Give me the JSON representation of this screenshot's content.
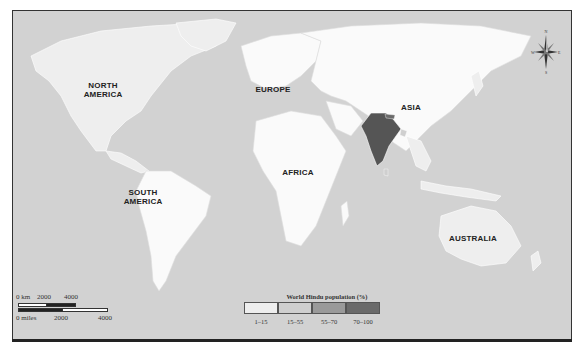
{
  "map": {
    "title": "World Hindu population (%)",
    "continent_labels": [
      {
        "name": "NORTH AMERICA",
        "line1": "NORTH",
        "line2": "AMERICA"
      },
      {
        "name": "SOUTH AMERICA",
        "line1": "SOUTH",
        "line2": "AMERICA"
      },
      {
        "name": "EUROPE",
        "line1": "EUROPE",
        "line2": ""
      },
      {
        "name": "AFRICA",
        "line1": "AFRICA",
        "line2": ""
      },
      {
        "name": "ASIA",
        "line1": "ASIA",
        "line2": ""
      },
      {
        "name": "AUSTRALIA",
        "line1": "AUSTRALIA",
        "line2": ""
      }
    ],
    "legend": {
      "title": "World Hindu population (%)",
      "items": [
        {
          "label": "1–15",
          "color": "#eeeeee"
        },
        {
          "label": "15–55",
          "color": "#cfcfcf"
        },
        {
          "label": "55–70",
          "color": "#9a9a9a"
        },
        {
          "label": "70–100",
          "color": "#6a6a6a"
        }
      ]
    },
    "scale_bar": {
      "km_label": "0 km",
      "km_ticks": [
        "2000",
        "4000"
      ],
      "miles_label": "0 miles",
      "miles_ticks": [
        "2000",
        "4000"
      ]
    },
    "compass": {
      "n": "N",
      "s": "S",
      "e": "E",
      "w": "W"
    },
    "colors": {
      "ocean": "#d2d2d2",
      "land_low": "#eeeeee",
      "land_white": "#fafafa",
      "india": "#555555",
      "nepal": "#6a6a6a"
    }
  }
}
